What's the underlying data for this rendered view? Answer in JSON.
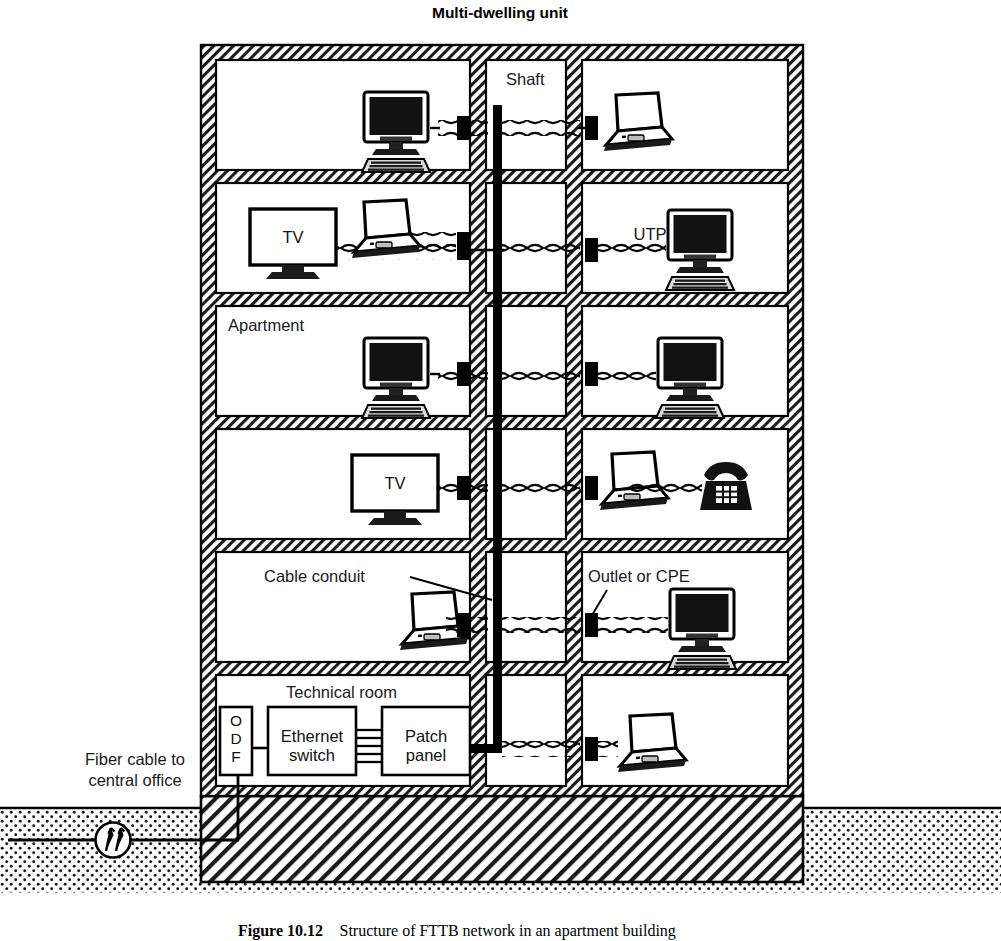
{
  "figure": {
    "title": "Multi-dwelling unit",
    "caption_label": "Figure 10.12",
    "caption_text": "Structure of FTTB network in an apartment building"
  },
  "labels": {
    "shaft": "Shaft",
    "utp": "UTP",
    "apartment": "Apartment",
    "tv_floor5": "TV",
    "tv_floor3": "TV",
    "cable_conduit": "Cable conduit",
    "outlet_or_cpe": "Outlet or CPE",
    "technical_room": "Technical room",
    "fiber_cable_line1": "Fiber cable to",
    "fiber_cable_line2": "central office"
  },
  "technical_room": {
    "odf": [
      "O",
      "D",
      "F"
    ],
    "ethernet_switch_line1": "Ethernet",
    "ethernet_switch_line2": "switch",
    "patch_panel_line1": "Patch",
    "patch_panel_line2": "panel"
  },
  "floors": [
    {
      "id": "floor-6",
      "left_devices": [
        "desktop-computer"
      ],
      "right_devices": [
        "laptop"
      ]
    },
    {
      "id": "floor-5",
      "left_devices": [
        "tv",
        "laptop"
      ],
      "right_devices": [
        "desktop-computer"
      ]
    },
    {
      "id": "floor-4",
      "left_devices": [
        "desktop-computer"
      ],
      "right_devices": [
        "desktop-computer"
      ]
    },
    {
      "id": "floor-3",
      "left_devices": [
        "tv"
      ],
      "right_devices": [
        "laptop",
        "telephone"
      ]
    },
    {
      "id": "floor-2",
      "left_devices": [
        "laptop"
      ],
      "right_devices": [
        "desktop-computer"
      ]
    },
    {
      "id": "floor-1",
      "left_devices": [
        "odf",
        "ethernet-switch",
        "patch-panel"
      ],
      "right_devices": [
        "laptop"
      ]
    }
  ],
  "colors": {
    "ink": "#000000",
    "wall_fill": "#ffffff",
    "room_fill": "#ffffff",
    "ground_fill": "#ffffff",
    "page_bg": "#ffffff"
  }
}
